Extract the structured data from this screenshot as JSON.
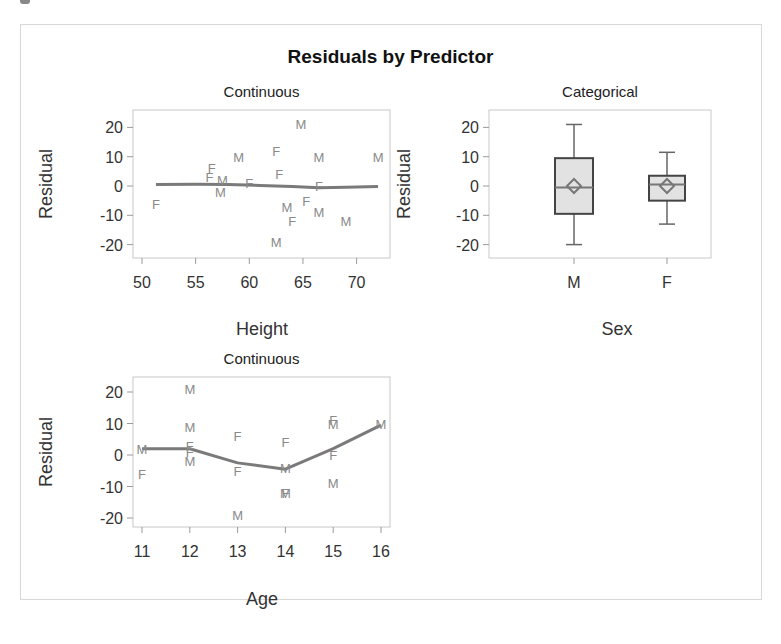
{
  "figure": {
    "title": "Residuals by Predictor"
  },
  "panels": [
    {
      "id": "height",
      "subtitle": "Continuous",
      "xlabel": "Height",
      "ylabel": "Residual",
      "xticks": [
        "50",
        "55",
        "60",
        "65",
        "70"
      ],
      "yticks": [
        "20",
        "10",
        "0",
        "-10",
        "-20"
      ]
    },
    {
      "id": "sex",
      "subtitle": "Categorical",
      "xlabel": "Sex",
      "ylabel": "Residual",
      "xticks": [
        "M",
        "F"
      ],
      "yticks": [
        "20",
        "10",
        "0",
        "-10",
        "-20"
      ]
    },
    {
      "id": "age",
      "subtitle": "Continuous",
      "xlabel": "Age",
      "ylabel": "Residual",
      "xticks": [
        "11",
        "12",
        "13",
        "14",
        "15",
        "16"
      ],
      "yticks": [
        "20",
        "10",
        "0",
        "-10",
        "-20"
      ]
    }
  ],
  "chart_data": [
    {
      "type": "scatter",
      "title": "Continuous",
      "xlabel": "Height",
      "ylabel": "Residual",
      "xlim": [
        49.5,
        73
      ],
      "ylim": [
        -25,
        25
      ],
      "grid": false,
      "marker": "text label by Sex (M/F)",
      "points": [
        {
          "x": 51.3,
          "y": -6,
          "label": "F"
        },
        {
          "x": 56.3,
          "y": 3,
          "label": "F"
        },
        {
          "x": 56.5,
          "y": 6,
          "label": "F"
        },
        {
          "x": 57.5,
          "y": 2,
          "label": "M"
        },
        {
          "x": 57.3,
          "y": -2,
          "label": "M"
        },
        {
          "x": 59.0,
          "y": 10,
          "label": "M"
        },
        {
          "x": 60.0,
          "y": 1,
          "label": "F"
        },
        {
          "x": 62.5,
          "y": 12,
          "label": "F"
        },
        {
          "x": 62.8,
          "y": 4,
          "label": "F"
        },
        {
          "x": 62.5,
          "y": -19,
          "label": "M"
        },
        {
          "x": 63.5,
          "y": -7,
          "label": "M"
        },
        {
          "x": 64.0,
          "y": -12,
          "label": "F"
        },
        {
          "x": 64.8,
          "y": 21,
          "label": "M"
        },
        {
          "x": 65.3,
          "y": -5,
          "label": "F"
        },
        {
          "x": 66.5,
          "y": 0,
          "label": "F"
        },
        {
          "x": 66.5,
          "y": 10,
          "label": "M"
        },
        {
          "x": 66.5,
          "y": -9,
          "label": "M"
        },
        {
          "x": 69.0,
          "y": -12,
          "label": "M"
        },
        {
          "x": 72.0,
          "y": 10,
          "label": "M"
        }
      ],
      "smooth_line": {
        "x": [
          51.3,
          55,
          58,
          61,
          64,
          66.5,
          69,
          72
        ],
        "y": [
          0.5,
          0.6,
          0.5,
          0.2,
          -0.2,
          -0.6,
          -0.4,
          -0.2
        ]
      }
    },
    {
      "type": "box",
      "title": "Categorical",
      "xlabel": "Sex",
      "ylabel": "Residual",
      "ylim": [
        -25,
        25
      ],
      "categories": [
        "M",
        "F"
      ],
      "boxes": [
        {
          "category": "M",
          "min": -20,
          "q1": -9.5,
          "median": -0.5,
          "q3": 9.5,
          "max": 21,
          "mean": 0
        },
        {
          "category": "F",
          "min": -13,
          "q1": -5,
          "median": 0.5,
          "q3": 3.5,
          "max": 11.5,
          "mean": 0
        }
      ]
    },
    {
      "type": "scatter",
      "title": "Continuous",
      "xlabel": "Age",
      "ylabel": "Residual",
      "xlim": [
        10.8,
        16.2
      ],
      "ylim": [
        -25,
        25
      ],
      "grid": false,
      "marker": "text label by Sex (M/F)",
      "points": [
        {
          "x": 11,
          "y": 2,
          "label": "M"
        },
        {
          "x": 11,
          "y": -6,
          "label": "F"
        },
        {
          "x": 12,
          "y": 21,
          "label": "M"
        },
        {
          "x": 12,
          "y": 9,
          "label": "M"
        },
        {
          "x": 12,
          "y": 3,
          "label": "F"
        },
        {
          "x": 12,
          "y": 1,
          "label": "F"
        },
        {
          "x": 12,
          "y": -2,
          "label": "M"
        },
        {
          "x": 13,
          "y": 6,
          "label": "F"
        },
        {
          "x": 13,
          "y": -5,
          "label": "F"
        },
        {
          "x": 13,
          "y": -19,
          "label": "M"
        },
        {
          "x": 14,
          "y": 4,
          "label": "F"
        },
        {
          "x": 14,
          "y": -4,
          "label": "M"
        },
        {
          "x": 14,
          "y": -12,
          "label": "M"
        },
        {
          "x": 14,
          "y": -12,
          "label": "F"
        },
        {
          "x": 15,
          "y": 11,
          "label": "F"
        },
        {
          "x": 15,
          "y": 10,
          "label": "M"
        },
        {
          "x": 15,
          "y": 0,
          "label": "F"
        },
        {
          "x": 15,
          "y": -9,
          "label": "M"
        },
        {
          "x": 16,
          "y": 10,
          "label": "M"
        }
      ],
      "smooth_line": {
        "x": [
          11,
          12,
          13,
          14,
          15,
          16
        ],
        "y": [
          2,
          2,
          -2.5,
          -4.5,
          2,
          9.5
        ]
      }
    }
  ]
}
